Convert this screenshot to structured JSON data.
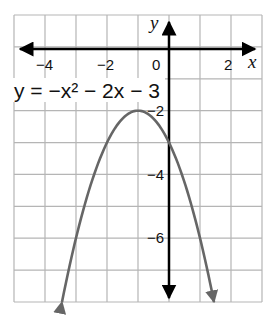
{
  "chart_data": {
    "type": "line",
    "title": "",
    "equation_label": "y = −x² − 2x − 3",
    "xlabel": "x",
    "ylabel": "y",
    "xlim": [
      -5,
      3
    ],
    "ylim": [
      -8,
      1
    ],
    "grid": true,
    "x_ticks": [
      {
        "value": -4,
        "label": "−4"
      },
      {
        "value": -2,
        "label": "−2"
      },
      {
        "value": 0,
        "label": "0"
      },
      {
        "value": 2,
        "label": "2"
      }
    ],
    "y_ticks": [
      {
        "value": -2,
        "label": "−2"
      },
      {
        "value": -4,
        "label": "−4"
      },
      {
        "value": -6,
        "label": "−6"
      }
    ],
    "series": [
      {
        "name": "y = −x² − 2x − 3",
        "function": "-x^2 - 2x - 3",
        "vertex": [
          -1,
          -2
        ],
        "y_intercept": -3,
        "x": [
          -3.45,
          -3,
          -2.5,
          -2,
          -1.5,
          -1,
          -0.5,
          0,
          0.5,
          1,
          1.45
        ],
        "values": [
          -8.0,
          -6.0,
          -4.25,
          -3.0,
          -2.25,
          -2.0,
          -2.25,
          -3.0,
          -4.25,
          -6.0,
          -8.0
        ],
        "color": "#666666",
        "arrows_at_ends": true
      }
    ],
    "colors": {
      "grid": "#b5b5b5",
      "axes": "#000000",
      "curve": "#666666"
    }
  }
}
